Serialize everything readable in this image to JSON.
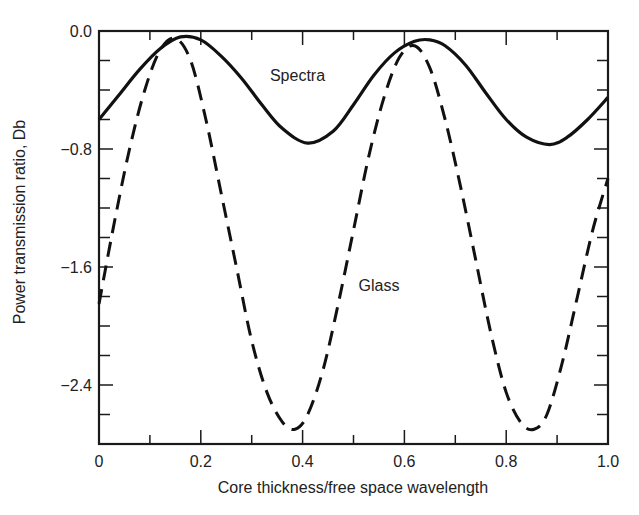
{
  "chart_data": {
    "type": "line",
    "title": "",
    "xlabel": "Core thickness/free space wavelength",
    "ylabel": "Power transmission ratio, Db",
    "xlim": [
      0,
      1.0
    ],
    "ylim": [
      -2.8,
      0.0
    ],
    "x_ticks": [
      "0",
      "0.2",
      "0.4",
      "0.6",
      "0.8",
      "1.0"
    ],
    "y_ticks": [
      "0.0",
      "−0.8",
      "−1.6",
      "−2.4"
    ],
    "x_minor_step": 0.1,
    "y_minor_step": 0.2,
    "grid": false,
    "legend": "inline annotations",
    "series": [
      {
        "name": "Spectra",
        "style": "solid",
        "x": [
          0.0,
          0.04,
          0.08,
          0.12,
          0.16,
          0.2,
          0.24,
          0.28,
          0.32,
          0.36,
          0.41,
          0.46,
          0.5,
          0.54,
          0.58,
          0.62,
          0.65,
          0.68,
          0.72,
          0.76,
          0.8,
          0.84,
          0.885,
          0.92,
          0.96,
          1.0
        ],
        "values": [
          -0.6,
          -0.43,
          -0.26,
          -0.12,
          -0.04,
          -0.06,
          -0.17,
          -0.32,
          -0.5,
          -0.66,
          -0.76,
          -0.68,
          -0.5,
          -0.3,
          -0.15,
          -0.07,
          -0.06,
          -0.1,
          -0.23,
          -0.42,
          -0.6,
          -0.72,
          -0.77,
          -0.72,
          -0.6,
          -0.45
        ]
      },
      {
        "name": "Glass",
        "style": "dashed",
        "x": [
          0.0,
          0.03,
          0.06,
          0.09,
          0.12,
          0.15,
          0.18,
          0.21,
          0.24,
          0.27,
          0.3,
          0.33,
          0.36,
          0.385,
          0.41,
          0.44,
          0.47,
          0.5,
          0.53,
          0.56,
          0.59,
          0.62,
          0.65,
          0.68,
          0.71,
          0.74,
          0.77,
          0.8,
          0.83,
          0.855,
          0.88,
          0.91,
          0.94,
          0.97,
          1.0
        ],
        "values": [
          -1.85,
          -1.3,
          -0.8,
          -0.4,
          -0.13,
          -0.05,
          -0.2,
          -0.6,
          -1.1,
          -1.6,
          -2.1,
          -2.45,
          -2.65,
          -2.7,
          -2.6,
          -2.3,
          -1.85,
          -1.35,
          -0.85,
          -0.45,
          -0.18,
          -0.1,
          -0.25,
          -0.6,
          -1.05,
          -1.55,
          -2.05,
          -2.45,
          -2.66,
          -2.7,
          -2.6,
          -2.25,
          -1.8,
          -1.35,
          -1.0
        ]
      }
    ],
    "annotations": [
      {
        "text": "Spectra",
        "x": 0.39,
        "y": -0.3
      },
      {
        "text": "Glass",
        "x": 0.55,
        "y": -1.72
      }
    ]
  }
}
